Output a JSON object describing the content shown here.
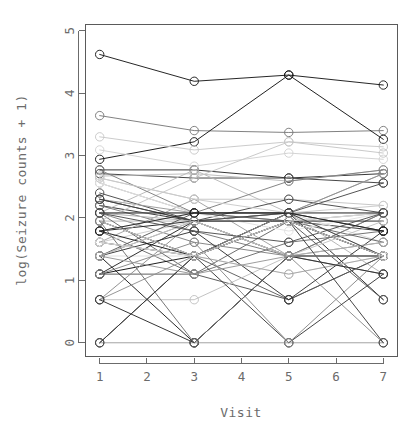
{
  "chart_data": {
    "type": "line",
    "title": "",
    "subtitle": "",
    "xlabel": "Visit",
    "ylabel": "log(Seizure counts + 1)",
    "x": [
      1,
      3,
      5,
      7
    ],
    "xlim": [
      0.7,
      7.3
    ],
    "ylim": [
      -0.22,
      5.1
    ],
    "xticks": [
      1,
      2,
      3,
      4,
      5,
      6,
      7
    ],
    "xticklabels": [
      "1",
      "2",
      "3",
      "4",
      "5",
      "6",
      "7"
    ],
    "yticks": [
      0,
      1,
      2,
      3,
      4,
      5
    ],
    "yticklabels": [
      "0",
      "1",
      "2",
      "3",
      "4",
      "5"
    ],
    "grid": false,
    "legend": null,
    "marker": "open-circle",
    "marker_size": 4.2,
    "box": true,
    "series": [
      {
        "name": "s01",
        "values": [
          4.62,
          4.19,
          4.29,
          4.13
        ],
        "color": "#1a1a1a"
      },
      {
        "name": "s02",
        "values": [
          3.64,
          3.4,
          3.37,
          3.4
        ],
        "color": "#7a7a7a"
      },
      {
        "name": "s03",
        "values": [
          2.94,
          3.22,
          4.29,
          3.26
        ],
        "color": "#141414"
      },
      {
        "name": "s04",
        "values": [
          3.3,
          3.09,
          3.22,
          3.14
        ],
        "color": "#c8c8c8"
      },
      {
        "name": "s05",
        "values": [
          3.09,
          2.83,
          3.04,
          2.94
        ],
        "color": "#d2d2d2"
      },
      {
        "name": "s06",
        "values": [
          2.77,
          2.77,
          2.64,
          2.71
        ],
        "color": "#2b2b2b"
      },
      {
        "name": "s07",
        "values": [
          2.71,
          2.64,
          2.64,
          2.56
        ],
        "color": "#3d3d3d"
      },
      {
        "name": "s08",
        "values": [
          2.67,
          2.71,
          2.59,
          2.77
        ],
        "color": "#bcbcbc"
      },
      {
        "name": "s09",
        "values": [
          2.64,
          2.3,
          2.3,
          2.2
        ],
        "color": "#c4c4c4"
      },
      {
        "name": "s10",
        "values": [
          2.56,
          2.08,
          2.08,
          2.71
        ],
        "color": "#a8a8a8"
      },
      {
        "name": "s11",
        "values": [
          2.4,
          1.95,
          2.08,
          2.56
        ],
        "color": "#4a4a4a"
      },
      {
        "name": "s12",
        "values": [
          2.3,
          2.08,
          1.95,
          2.08
        ],
        "color": "#9c9c9c"
      },
      {
        "name": "s13",
        "values": [
          2.2,
          1.95,
          1.95,
          1.79
        ],
        "color": "#303030"
      },
      {
        "name": "s14",
        "values": [
          2.08,
          1.61,
          1.39,
          2.08
        ],
        "color": "#828282"
      },
      {
        "name": "s15",
        "values": [
          2.08,
          2.08,
          2.08,
          1.61
        ],
        "color": "#d8d8d8"
      },
      {
        "name": "s16",
        "values": [
          1.95,
          1.39,
          0.69,
          1.39
        ],
        "color": "#5e5e5e"
      },
      {
        "name": "s17",
        "values": [
          1.95,
          1.95,
          2.08,
          1.1
        ],
        "color": "#b4b4b4"
      },
      {
        "name": "s18",
        "values": [
          1.79,
          1.95,
          1.39,
          1.39
        ],
        "color": "#1f1f1f"
      },
      {
        "name": "s19",
        "values": [
          1.79,
          1.1,
          1.61,
          1.79
        ],
        "color": "#6e6e6e"
      },
      {
        "name": "s20",
        "values": [
          1.61,
          1.95,
          1.95,
          1.39
        ],
        "color": "#cccccc"
      },
      {
        "name": "s21",
        "values": [
          1.61,
          1.39,
          2.08,
          0.69
        ],
        "color": "#242424"
      },
      {
        "name": "s22",
        "values": [
          1.39,
          1.95,
          1.39,
          1.61
        ],
        "color": "#9a9a9a"
      },
      {
        "name": "s23",
        "values": [
          1.39,
          1.39,
          1.1,
          1.39
        ],
        "color": "#dedede"
      },
      {
        "name": "s24",
        "values": [
          1.1,
          1.39,
          1.95,
          1.39
        ],
        "color": "#111111"
      },
      {
        "name": "s25",
        "values": [
          1.1,
          1.1,
          0.69,
          1.39
        ],
        "color": "#555555"
      },
      {
        "name": "s26",
        "values": [
          0.69,
          0.69,
          1.39,
          1.1
        ],
        "color": "#c0c0c0"
      },
      {
        "name": "s27",
        "values": [
          0.69,
          1.95,
          1.39,
          0.0
        ],
        "color": "#8c8c8c"
      },
      {
        "name": "s28",
        "values": [
          0.0,
          1.39,
          2.08,
          1.79
        ],
        "color": "#2f2f2f"
      },
      {
        "name": "s29",
        "values": [
          0.0,
          0.0,
          0.0,
          0.0
        ],
        "color": "#9e9e9e"
      },
      {
        "name": "s30",
        "values": [
          1.95,
          1.39,
          0.0,
          1.1
        ],
        "color": "#3a3a3a"
      },
      {
        "name": "s31",
        "values": [
          2.08,
          2.77,
          2.08,
          1.39
        ],
        "color": "#b8b8b8"
      },
      {
        "name": "s32",
        "values": [
          2.2,
          1.79,
          1.39,
          2.08
        ],
        "color": "#787878"
      },
      {
        "name": "s33",
        "values": [
          1.39,
          0.0,
          1.39,
          1.39
        ],
        "color": "#1c1c1c"
      },
      {
        "name": "s34",
        "values": [
          1.79,
          2.08,
          1.95,
          2.08
        ],
        "color": "#d0d0d0"
      },
      {
        "name": "s35",
        "values": [
          2.08,
          1.1,
          1.95,
          1.61
        ],
        "color": "#666666"
      },
      {
        "name": "s36",
        "values": [
          1.61,
          2.3,
          1.39,
          1.1
        ],
        "color": "#a0a0a0"
      },
      {
        "name": "s37",
        "values": [
          2.3,
          1.95,
          2.3,
          2.08
        ],
        "color": "#484848"
      },
      {
        "name": "s38",
        "values": [
          2.56,
          2.08,
          1.79,
          2.08
        ],
        "color": "#e0e0e0"
      },
      {
        "name": "s39",
        "values": [
          1.1,
          1.95,
          1.95,
          1.95
        ],
        "color": "#262626"
      },
      {
        "name": "s40",
        "values": [
          0.69,
          1.39,
          2.08,
          2.71
        ],
        "color": "#909090"
      },
      {
        "name": "s41",
        "values": [
          1.39,
          1.79,
          0.69,
          1.79
        ],
        "color": "#343434"
      },
      {
        "name": "s42",
        "values": [
          1.95,
          2.64,
          3.22,
          3.04
        ],
        "color": "#c6c6c6"
      },
      {
        "name": "s43",
        "values": [
          2.77,
          2.08,
          2.59,
          2.77
        ],
        "color": "#7e7e7e"
      },
      {
        "name": "s44",
        "values": [
          1.79,
          1.39,
          1.95,
          1.39
        ],
        "color": "#181818"
      },
      {
        "name": "s45",
        "values": [
          2.08,
          1.95,
          1.39,
          1.61
        ],
        "color": "#b0b0b0"
      },
      {
        "name": "s46",
        "values": [
          1.39,
          2.08,
          1.95,
          0.69
        ],
        "color": "#5a5a5a"
      },
      {
        "name": "s47",
        "values": [
          1.95,
          1.39,
          1.95,
          2.08
        ],
        "color": "#d6d6d6"
      },
      {
        "name": "s48",
        "values": [
          2.3,
          1.95,
          2.08,
          1.39
        ],
        "color": "#404040"
      },
      {
        "name": "s49",
        "values": [
          1.61,
          1.39,
          1.1,
          1.39
        ],
        "color": "#a6a6a6"
      },
      {
        "name": "s50",
        "values": [
          0.69,
          0.0,
          1.39,
          1.1
        ],
        "color": "#2a2a2a"
      },
      {
        "name": "s51",
        "values": [
          1.1,
          1.61,
          0.0,
          1.39
        ],
        "color": "#888888"
      },
      {
        "name": "s52",
        "values": [
          2.08,
          2.08,
          2.08,
          2.08
        ],
        "color": "#151515"
      },
      {
        "name": "s53",
        "values": [
          1.39,
          1.95,
          1.39,
          1.95
        ],
        "color": "#c2c2c2"
      },
      {
        "name": "s54",
        "values": [
          1.95,
          0.0,
          1.39,
          1.39
        ],
        "color": "#707070"
      },
      {
        "name": "s55",
        "values": [
          0.0,
          1.39,
          1.95,
          0.0
        ],
        "color": "#3c3c3c"
      },
      {
        "name": "s56",
        "values": [
          2.64,
          2.3,
          2.08,
          2.2
        ],
        "color": "#cacaca"
      },
      {
        "name": "s57",
        "values": [
          1.79,
          2.08,
          2.08,
          1.79
        ],
        "color": "#222222"
      },
      {
        "name": "s58",
        "values": [
          1.39,
          1.1,
          1.39,
          1.39
        ],
        "color": "#989898"
      },
      {
        "name": "s59",
        "values": [
          2.08,
          1.79,
          1.61,
          2.08
        ],
        "color": "#4e4e4e"
      },
      {
        "name": "s60",
        "values": [
          1.61,
          1.39,
          1.95,
          1.39
        ],
        "color": "#dcdcdc"
      }
    ]
  },
  "axes": {
    "x_label": "Visit",
    "y_label": "log(Seizure counts + 1)"
  }
}
